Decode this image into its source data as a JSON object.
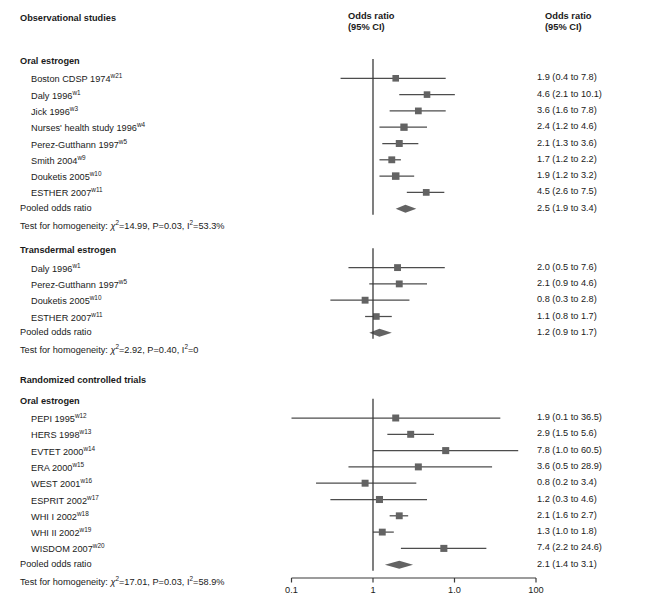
{
  "header": {
    "left_title": "Observational studies",
    "col_center_line1": "Odds ratio",
    "col_center_line2": "(95% CI)",
    "col_right_line1": "Odds ratio",
    "col_right_line2": "(95% CI)"
  },
  "axis": {
    "ticks": [
      "0.1",
      "1",
      "1.0",
      "100"
    ],
    "tick_values": [
      0.1,
      1,
      10,
      100
    ],
    "scale": "log",
    "null_value": 1
  },
  "colors": {
    "marker": "#636363",
    "line": "#4d4d4d",
    "axis": "#3a3a3a",
    "text": "#1a1a1a"
  },
  "sections": [
    {
      "id": "observational",
      "title": "Observational studies",
      "is_major": true,
      "subgroups": [
        {
          "id": "obs-oral",
          "title": "Oral estrogen",
          "rows": [
            {
              "label": "Boston CDSP 1974",
              "sup": "w21",
              "or": 1.9,
              "lo": 0.4,
              "hi": 7.8,
              "weight": 0.52,
              "text": "1.9 (0.4 to 7.8)"
            },
            {
              "label": "Daly 1996",
              "sup": "w1",
              "or": 4.6,
              "lo": 2.1,
              "hi": 10.1,
              "weight": 0.52,
              "text": "4.6 (2.1 to 10.1)"
            },
            {
              "label": "Jick 1996",
              "sup": "w3",
              "or": 3.6,
              "lo": 1.6,
              "hi": 7.8,
              "weight": 0.55,
              "text": "3.6 (1.6 to 7.8)"
            },
            {
              "label": "Nurses' health study 1996",
              "sup": "w4",
              "or": 2.4,
              "lo": 1.2,
              "hi": 4.6,
              "weight": 0.68,
              "text": "2.4 (1.2 to 4.6)"
            },
            {
              "label": "Perez-Gutthann 1997",
              "sup": "w5",
              "or": 2.1,
              "lo": 1.3,
              "hi": 3.6,
              "weight": 0.6,
              "text": "2.1 (1.3 to 3.6)"
            },
            {
              "label": "Smith 2004",
              "sup": "w9",
              "or": 1.7,
              "lo": 1.2,
              "hi": 2.2,
              "weight": 0.58,
              "text": "1.7 (1.2 to 2.2)"
            },
            {
              "label": "Douketis 2005",
              "sup": "w10",
              "or": 1.9,
              "lo": 1.2,
              "hi": 3.2,
              "weight": 0.72,
              "text": "1.9 (1.2 to 3.2)"
            },
            {
              "label": "ESTHER 2007",
              "sup": "w11",
              "or": 4.5,
              "lo": 2.6,
              "hi": 7.5,
              "weight": 0.55,
              "text": "4.5 (2.6 to 7.5)"
            }
          ],
          "pooled": {
            "label": "Pooled odds ratio",
            "or": 2.5,
            "lo": 1.9,
            "hi": 3.4,
            "text": "2.5 (1.9 to 3.4)"
          },
          "homogeneity": {
            "prefix": "Test for homogeneity: ",
            "chi": "=14.99, P=0.03, ",
            "i2": "=53.3%"
          }
        }
      ]
    },
    {
      "id": "obs-transdermal",
      "title": "Transdermal estrogen",
      "is_major": false,
      "subgroups": [
        {
          "id": "trans-group",
          "title": "Transdermal estrogen",
          "rows": [
            {
              "label": "Daly 1996",
              "sup": "w1",
              "or": 2.0,
              "lo": 0.5,
              "hi": 7.6,
              "weight": 0.58,
              "text": "2.0 (0.5 to 7.6)"
            },
            {
              "label": "Perez-Gutthann 1997",
              "sup": "w5",
              "or": 2.1,
              "lo": 0.9,
              "hi": 4.6,
              "weight": 0.58,
              "text": "2.1 (0.9 to 4.6)"
            },
            {
              "label": "Douketis 2005",
              "sup": "w10",
              "or": 0.8,
              "lo": 0.3,
              "hi": 2.8,
              "weight": 0.58,
              "text": "0.8 (0.3 to 2.8)"
            },
            {
              "label": "ESTHER 2007",
              "sup": "w11",
              "or": 1.1,
              "lo": 0.8,
              "hi": 1.7,
              "weight": 0.52,
              "text": "1.1 (0.8 to 1.7)"
            }
          ],
          "pooled": {
            "label": "Pooled odds ratio",
            "or": 1.2,
            "lo": 0.9,
            "hi": 1.7,
            "text": "1.2 (0.9 to 1.7)"
          },
          "homogeneity": {
            "prefix": "Test for homogeneity: ",
            "chi": "=2.92, P=0.40, ",
            "i2": "=0"
          }
        }
      ]
    },
    {
      "id": "rct",
      "title": "Randomized controlled trials",
      "is_major": true,
      "subgroups": [
        {
          "id": "rct-oral",
          "title": "Oral estrogen",
          "rows": [
            {
              "label": "PEPI 1995",
              "sup": "w12",
              "or": 1.9,
              "lo": 0.1,
              "hi": 36.5,
              "weight": 0.6,
              "text": "1.9 (0.1 to 36.5)"
            },
            {
              "label": "HERS 1998",
              "sup": "w13",
              "or": 2.9,
              "lo": 1.5,
              "hi": 5.6,
              "weight": 0.6,
              "text": "2.9 (1.5 to 5.6)"
            },
            {
              "label": "EVTET 2000",
              "sup": "w14",
              "or": 7.8,
              "lo": 1.0,
              "hi": 60.5,
              "weight": 0.62,
              "text": "7.8 (1.0 to 60.5)"
            },
            {
              "label": "ERA 2000",
              "sup": "w15",
              "or": 3.6,
              "lo": 0.5,
              "hi": 28.9,
              "weight": 0.6,
              "text": "3.6 (0.5 to 28.9)"
            },
            {
              "label": "WEST 2001",
              "sup": "w16",
              "or": 0.8,
              "lo": 0.2,
              "hi": 3.4,
              "weight": 0.6,
              "text": "0.8 (0.2 to 3.4)"
            },
            {
              "label": "ESPRIT 2002",
              "sup": "w17",
              "or": 1.2,
              "lo": 0.3,
              "hi": 4.6,
              "weight": 0.62,
              "text": "1.2 (0.3 to 4.6)"
            },
            {
              "label": "WHI I 2002",
              "sup": "w18",
              "or": 2.1,
              "lo": 1.6,
              "hi": 2.7,
              "weight": 0.58,
              "text": "2.1 (1.6 to 2.7)"
            },
            {
              "label": "WHI II 2002",
              "sup": "w19",
              "or": 1.3,
              "lo": 1.0,
              "hi": 1.8,
              "weight": 0.58,
              "text": "1.3 (1.0 to 1.8)"
            },
            {
              "label": "WISDOM 2007",
              "sup": "w20",
              "or": 7.4,
              "lo": 2.2,
              "hi": 24.6,
              "weight": 0.62,
              "text": "7.4 (2.2 to 24.6)"
            }
          ],
          "pooled": {
            "label": "Pooled odds ratio",
            "or": 2.1,
            "lo": 1.4,
            "hi": 3.1,
            "text": "2.1 (1.4 to 3.1)"
          },
          "homogeneity": {
            "prefix": "Test for homogeneity: ",
            "chi": "=17.01, P=0.03, ",
            "i2": "=58.9%"
          }
        }
      ]
    }
  ]
}
